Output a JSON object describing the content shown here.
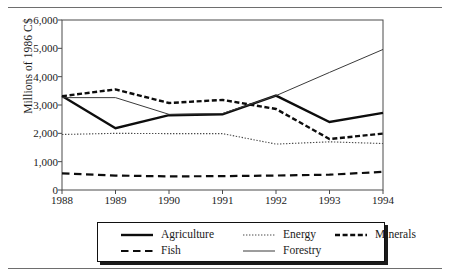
{
  "chart_data": {
    "type": "line",
    "title": "",
    "xlabel": "",
    "ylabel": "Millions of 1986 C$",
    "categories": [
      "1988",
      "1989",
      "1990",
      "1991",
      "1992",
      "1993",
      "1994"
    ],
    "x": [
      1988,
      1989,
      1990,
      1991,
      1992,
      1993,
      1994
    ],
    "ylim": [
      0,
      6000
    ],
    "ytick_labels": [
      "0",
      "1,000",
      "2,000",
      "3,000",
      "4,000",
      "5,000",
      "6,000"
    ],
    "ytick_values": [
      0,
      1000,
      2000,
      3000,
      4000,
      5000,
      6000
    ],
    "grid": false,
    "legend_position": "below-plot",
    "series": [
      {
        "name": "Agriculture",
        "style": "solid-thick",
        "values": [
          3320,
          2180,
          2640,
          2670,
          3330,
          2400,
          2720
        ]
      },
      {
        "name": "Energy",
        "style": "dotted-fine",
        "values": [
          1960,
          2000,
          1990,
          1990,
          1620,
          1700,
          1640
        ]
      },
      {
        "name": "Minerals",
        "style": "dashed-thick",
        "values": [
          3310,
          3550,
          3070,
          3180,
          2860,
          1800,
          1990
        ]
      },
      {
        "name": "Fish",
        "style": "dashed-long",
        "values": [
          590,
          510,
          480,
          490,
          510,
          540,
          640
        ]
      },
      {
        "name": "Forestry",
        "style": "solid-thin",
        "values": [
          3260,
          3260,
          2670,
          2700,
          3330,
          4150,
          4960
        ]
      }
    ]
  },
  "legend": {
    "rows": [
      [
        {
          "label": "Agriculture",
          "series": "Agriculture"
        },
        {
          "label": "Energy",
          "series": "Energy"
        },
        {
          "label": "Minerals",
          "series": "Minerals"
        }
      ],
      [
        {
          "label": "Fish",
          "series": "Fish"
        },
        {
          "label": "Forestry",
          "series": "Forestry"
        }
      ]
    ]
  }
}
